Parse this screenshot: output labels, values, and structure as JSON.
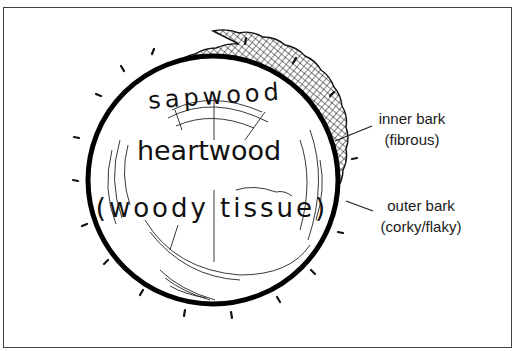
{
  "diagram": {
    "inner_labels": {
      "sapwood": "sapwood",
      "heartwood": "heartwood",
      "woody_tissue": "(woody tissue)"
    },
    "callouts": [
      {
        "id": "inner-bark",
        "line1": "inner bark",
        "line2": "(fibrous)"
      },
      {
        "id": "outer-bark",
        "line1": "outer bark",
        "line2": "(corky/flaky)"
      }
    ],
    "colors": {
      "ink": "#111111",
      "background": "#ffffff",
      "frame": "#444444"
    }
  }
}
